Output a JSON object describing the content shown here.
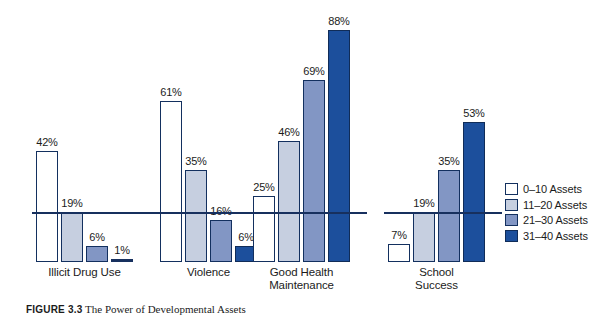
{
  "chart_data": {
    "type": "bar",
    "title": "",
    "subtitle": "",
    "xlabel": "",
    "ylabel": "",
    "ylim": [
      0,
      100
    ],
    "grid": false,
    "legend_position": "right",
    "categories": [
      "Illicit Drug Use",
      "Violence",
      "Good Health\nMaintenance",
      "School\nSuccess"
    ],
    "series": [
      {
        "name": "0–10 Assets",
        "color": "#ffffff",
        "values": [
          42,
          61,
          25,
          7
        ]
      },
      {
        "name": "11–20 Assets",
        "color": "#c6cfe0",
        "values": [
          19,
          35,
          46,
          19
        ]
      },
      {
        "name": "21–30 Assets",
        "color": "#8296c4",
        "values": [
          6,
          16,
          69,
          35
        ]
      },
      {
        "name": "31–40 Assets",
        "color": "#1c4f9c",
        "values": [
          1,
          6,
          88,
          53
        ]
      }
    ],
    "value_label_suffix": "%",
    "groups": [
      {
        "label_line1": "Illicit Drug Use",
        "label_line2": "",
        "bars": [
          {
            "value": 42,
            "label": "42%",
            "series": 0
          },
          {
            "value": 19,
            "label": "19%",
            "series": 1
          },
          {
            "value": 6,
            "label": "6%",
            "series": 2
          },
          {
            "value": 1,
            "label": "1%",
            "series": 3
          }
        ]
      },
      {
        "label_line1": "Violence",
        "label_line2": "",
        "bars": [
          {
            "value": 61,
            "label": "61%",
            "series": 0
          },
          {
            "value": 35,
            "label": "35%",
            "series": 1
          },
          {
            "value": 16,
            "label": "16%",
            "series": 2
          },
          {
            "value": 6,
            "label": "6%",
            "series": 3
          }
        ]
      },
      {
        "label_line1": "Good Health",
        "label_line2": "Maintenance",
        "bars": [
          {
            "value": 25,
            "label": "25%",
            "series": 0
          },
          {
            "value": 46,
            "label": "46%",
            "series": 1
          },
          {
            "value": 69,
            "label": "69%",
            "series": 2
          },
          {
            "value": 88,
            "label": "88%",
            "series": 3
          }
        ]
      },
      {
        "label_line1": "School",
        "label_line2": "Success",
        "bars": [
          {
            "value": 7,
            "label": "7%",
            "series": 0
          },
          {
            "value": 19,
            "label": "19%",
            "series": 1
          },
          {
            "value": 35,
            "label": "35%",
            "series": 2
          },
          {
            "value": 53,
            "label": "53%",
            "series": 3
          }
        ]
      }
    ]
  },
  "legend": {
    "items": [
      {
        "label": "0–10 Assets",
        "color": "#ffffff"
      },
      {
        "label": "11–20 Assets",
        "color": "#c6cfe0"
      },
      {
        "label": "21–30 Assets",
        "color": "#8296c4"
      },
      {
        "label": "31–40 Assets",
        "color": "#1c4f9c"
      }
    ]
  },
  "caption": {
    "figure_number": "FIGURE 3.3",
    "text": "The Power of Developmental Assets"
  }
}
